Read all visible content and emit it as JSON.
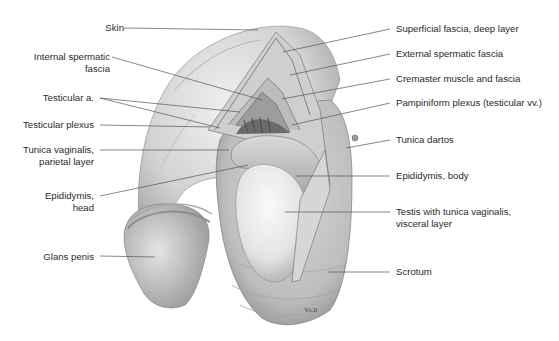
{
  "figure": {
    "type": "anatomical-illustration",
    "signature": "Vo.ll",
    "labels_left": [
      {
        "id": "skin",
        "lines": [
          "Skin"
        ]
      },
      {
        "id": "internal-spermatic-fascia",
        "lines": [
          "Internal spermatic",
          "fascia"
        ]
      },
      {
        "id": "testicular-a",
        "lines": [
          "Testicular a."
        ]
      },
      {
        "id": "testicular-plexus",
        "lines": [
          "Testicular plexus"
        ]
      },
      {
        "id": "tunica-vaginalis-parietal",
        "lines": [
          "Tunica vaginalis,",
          "parietal layer"
        ]
      },
      {
        "id": "epididymis-head",
        "lines": [
          "Epididymis,",
          "head"
        ]
      },
      {
        "id": "glans-penis",
        "lines": [
          "Glans penis"
        ]
      }
    ],
    "labels_right": [
      {
        "id": "superficial-fascia-deep",
        "lines": [
          "Superficial fascia, deep layer"
        ]
      },
      {
        "id": "external-spermatic-fascia",
        "lines": [
          "External spermatic fascia"
        ]
      },
      {
        "id": "cremaster-muscle",
        "lines": [
          "Cremaster muscle and fascia"
        ]
      },
      {
        "id": "pampiniform-plexus",
        "lines": [
          "Pampiniform plexus (testicular vv.)"
        ]
      },
      {
        "id": "tunica-dartos",
        "lines": [
          "Tunica dartos"
        ]
      },
      {
        "id": "epididymis-body",
        "lines": [
          "Epididymis, body"
        ]
      },
      {
        "id": "testis",
        "lines": [
          "Testis with tunica vaginalis,",
          "visceral layer"
        ]
      },
      {
        "id": "scrotum",
        "lines": [
          "Scrotum"
        ]
      }
    ],
    "colors": {
      "label_text": "#2a2a2a",
      "leader_line": "#555555",
      "tissue_light": "#e6e6e6",
      "tissue_mid": "#bdbdbd",
      "tissue_dark": "#7a7a7a"
    }
  }
}
